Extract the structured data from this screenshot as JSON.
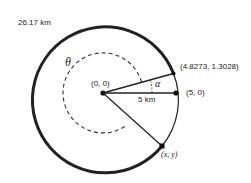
{
  "diagram": {
    "type": "geometry-circle",
    "colors": {
      "stroke": "#222222",
      "background": "#ffffff"
    },
    "labels": {
      "circumference": "26.17 km",
      "theta": "θ",
      "alpha": "α",
      "center": "(0, 0)",
      "radius": "5 km",
      "point_a": "(4.8273, 1.3028)",
      "point_b": "(5, 0)",
      "point_c": "(x, y)"
    },
    "geometry": {
      "center_px": [
        103,
        93
      ],
      "outer_radius_px": 73,
      "inner_dashed_radius_px": 40,
      "points": [
        {
          "name": "center",
          "coords": [
            0,
            0
          ]
        },
        {
          "name": "point_b",
          "coords": [
            5,
            0
          ]
        },
        {
          "name": "point_a",
          "coords": [
            4.8273,
            1.3028
          ]
        },
        {
          "name": "point_c",
          "coords": [
            "x",
            "y"
          ]
        }
      ]
    }
  }
}
